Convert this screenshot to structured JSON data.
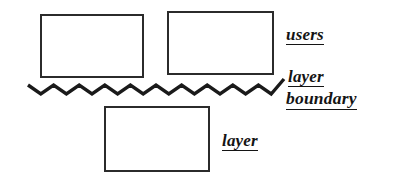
{
  "diagram": {
    "background_color": "#ffffff",
    "stroke_color": "#2b2b2b",
    "text_color": "#141414",
    "boxes": [
      {
        "name": "users-left",
        "label": ""
      },
      {
        "name": "users-right",
        "label": ""
      },
      {
        "name": "layer",
        "label": ""
      }
    ],
    "labels": {
      "users": "users",
      "layer_boundary_line1": "layer",
      "layer_boundary_line2": "boundary",
      "layer": "layer"
    },
    "separator": {
      "name": "zigzag-layer-boundary-line",
      "shape": "zigzag",
      "cycles": 10
    }
  }
}
